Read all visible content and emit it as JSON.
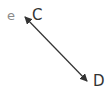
{
  "labels": {
    "e": "e",
    "c": "C",
    "d": "D"
  },
  "arrow": {
    "from": "C",
    "to": "D",
    "type": "double-headed",
    "color": "#333333"
  }
}
